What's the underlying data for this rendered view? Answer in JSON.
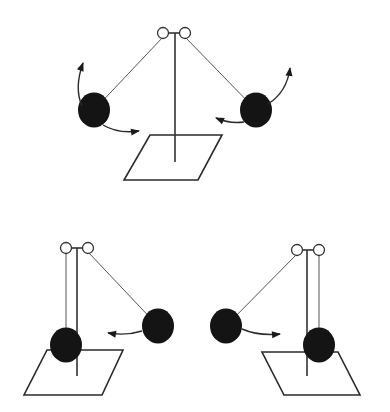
{
  "diagram": {
    "colors": {
      "ball": "#141414",
      "line": "#333333",
      "background": "#ffffff"
    },
    "figures": [
      {
        "id": "top",
        "label": "Two charged balls repelling",
        "pivots": [
          [
            163,
            33
          ],
          [
            185,
            33
          ]
        ],
        "stand": {
          "x": 175,
          "y1": 33,
          "y2": 162
        },
        "base": [
          [
            150,
            135
          ],
          [
            222,
            135
          ],
          [
            198,
            180
          ],
          [
            124,
            180
          ]
        ],
        "balls": [
          {
            "cx": 94,
            "cy": 110,
            "r": 16,
            "string_from": 0
          },
          {
            "cx": 256,
            "cy": 110,
            "r": 16,
            "string_from": 1
          }
        ],
        "arrows": [
          {
            "path": "M 82 106 Q 74 88 83 63",
            "direction": "up"
          },
          {
            "path": "M 103 125 Q 118 134 139 131",
            "direction": "right"
          },
          {
            "path": "M 268 104 Q 287 92 290 68",
            "direction": "up"
          },
          {
            "path": "M 244 122 Q 230 124 216 118",
            "direction": "left"
          }
        ]
      },
      {
        "id": "bottom-left",
        "label": "Charged ball attracted toward hanging ball",
        "pivots": [
          [
            66,
            248
          ],
          [
            88,
            248
          ]
        ],
        "stand": {
          "x": 77,
          "y1": 248,
          "y2": 376
        },
        "base": [
          [
            47,
            350
          ],
          [
            123,
            350
          ],
          [
            102,
            395
          ],
          [
            24,
            395
          ]
        ],
        "balls": [
          {
            "cx": 66,
            "cy": 345,
            "r": 16,
            "string_from": 0,
            "vertical": true
          },
          {
            "cx": 158,
            "cy": 326,
            "r": 16,
            "string_from": 1
          }
        ],
        "arrows": [
          {
            "path": "M 142 331 Q 126 336 108 333",
            "direction": "left"
          }
        ]
      },
      {
        "id": "bottom-right",
        "label": "Charged ball attracted toward hanging ball (mirrored)",
        "pivots": [
          [
            297,
            250
          ],
          [
            319,
            250
          ]
        ],
        "stand": {
          "x": 307,
          "y1": 250,
          "y2": 376
        },
        "base": [
          [
            262,
            352
          ],
          [
            338,
            352
          ],
          [
            360,
            395
          ],
          [
            284,
            395
          ]
        ],
        "balls": [
          {
            "cx": 319,
            "cy": 345,
            "r": 16,
            "string_from": 1,
            "vertical": true
          },
          {
            "cx": 226,
            "cy": 326,
            "r": 16,
            "string_from": 0
          }
        ],
        "arrows": [
          {
            "path": "M 242 329 Q 258 336 280 334",
            "direction": "right"
          }
        ]
      }
    ]
  }
}
